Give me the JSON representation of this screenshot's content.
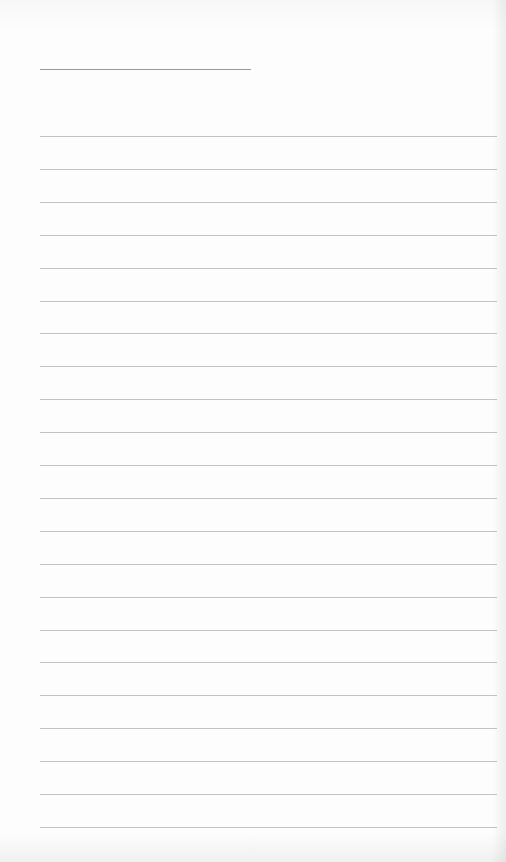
{
  "page": {
    "type": "lined-writing-sheet",
    "title_line": {
      "text": ""
    },
    "ruled_line_count": 22,
    "lines": [
      "",
      "",
      "",
      "",
      "",
      "",
      "",
      "",
      "",
      "",
      "",
      "",
      "",
      "",
      "",
      "",
      "",
      "",
      "",
      "",
      "",
      ""
    ],
    "colors": {
      "paper": "#fdfdfd",
      "rule": "#c2c2c2",
      "title_rule": "#9a9a9a"
    }
  }
}
